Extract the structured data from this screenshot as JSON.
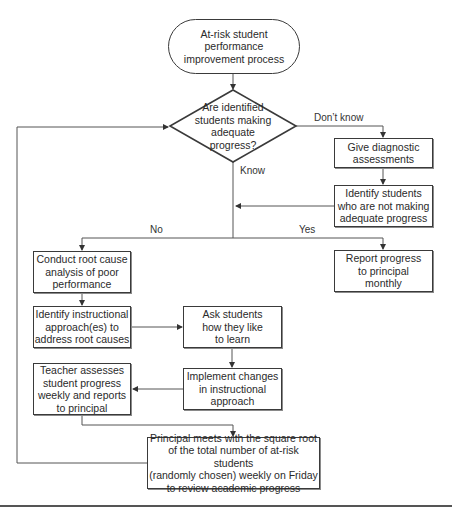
{
  "diagram": {
    "type": "flowchart",
    "start": {
      "label": "At-risk student\nperformance\nimprovement process"
    },
    "decision": {
      "label": "Are identified\nstudents making\nadequate\nprogress?"
    },
    "nodes": {
      "diagnostic": {
        "label": "Give diagnostic\nassessments"
      },
      "identify_students": {
        "label": "Identify students\nwho are not making\nadequate progress"
      },
      "root_cause": {
        "label": "Conduct root cause\nanalysis of poor\nperformance"
      },
      "report_progress": {
        "label": "Report progress\nto principal\nmonthly"
      },
      "identify_approach": {
        "label": "Identify instructional\napproach(es) to\naddress root causes"
      },
      "ask_students": {
        "label": "Ask students\nhow they like\nto learn"
      },
      "implement_changes": {
        "label": "Implement changes\nin instructional\napproach"
      },
      "teacher_assesses": {
        "label": "Teacher assesses\nstudent progress\nweekly and reports\nto principal"
      },
      "principal_meets": {
        "label": "Principal meets with the square root\nof the total number of at-risk students\n(randomly chosen) weekly on Friday\nto review academic progress"
      }
    },
    "edge_labels": {
      "dont_know": "Don’t know",
      "know": "Know",
      "no": "No",
      "yes": "Yes"
    },
    "colors": {
      "stroke": "#3a3a3a",
      "background": "#ffffff",
      "text": "#2a2a2a"
    }
  }
}
